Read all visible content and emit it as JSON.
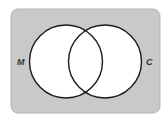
{
  "diagram": {
    "type": "venn",
    "universe": {
      "fill": "#c9c9c9",
      "stroke": "#b0b0b0"
    },
    "sets": [
      {
        "label": "M",
        "fill": "#ffffff",
        "stroke": "#1a1a1a"
      },
      {
        "label": "C",
        "fill": "#ffffff",
        "stroke": "#1a1a1a"
      }
    ]
  }
}
